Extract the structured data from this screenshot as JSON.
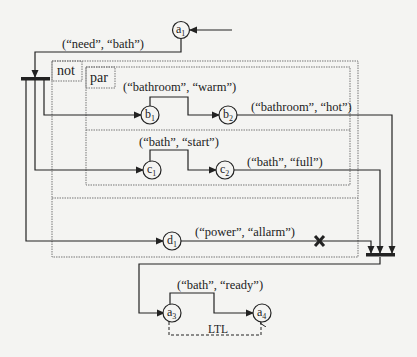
{
  "diagram": {
    "operators": {
      "not": "not",
      "par": "par"
    },
    "nodes": [
      {
        "id": "a1",
        "base": "a",
        "sub": "1"
      },
      {
        "id": "b1",
        "base": "b",
        "sub": "1"
      },
      {
        "id": "b2",
        "base": "b",
        "sub": "2"
      },
      {
        "id": "c1",
        "base": "c",
        "sub": "1"
      },
      {
        "id": "c2",
        "base": "c",
        "sub": "2"
      },
      {
        "id": "d1",
        "base": "d",
        "sub": "1"
      },
      {
        "id": "a3",
        "base": "a",
        "sub": "3"
      },
      {
        "id": "a4",
        "base": "a",
        "sub": "4"
      }
    ],
    "edges": {
      "need_bath": "(“need”, “bath”)",
      "bathroom_warm": "(“bathroom”, “warm”)",
      "bathroom_hot": "(“bathroom”, “hot”)",
      "bath_start": "(“bath”, “start”)",
      "bath_full": "(“bath”, “full”)",
      "power_allarm": "(“power”, “allarm”)",
      "bath_ready": "(“bath”, “ready”)",
      "ltl": "LTL"
    },
    "colors": {
      "ink": "#222222",
      "dotted": "#777777",
      "background": "#f4f4f2"
    }
  }
}
